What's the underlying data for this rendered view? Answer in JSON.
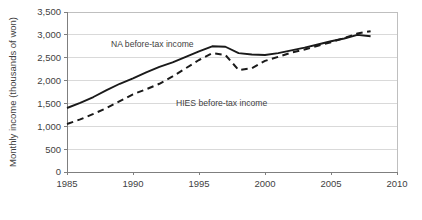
{
  "chart_data": {
    "type": "line",
    "title": "",
    "subtitle": "",
    "xlabel": "",
    "ylabel": "Monthly income (thousands of won)",
    "xlim": [
      1985,
      2010
    ],
    "ylim": [
      0,
      3500
    ],
    "grid": true,
    "legend_position": "inline-annotation",
    "x_ticks": [
      "1985",
      "1990",
      "1995",
      "2000",
      "2005",
      "2010"
    ],
    "x_tick_values": [
      1985,
      1990,
      1995,
      2000,
      2005,
      2010
    ],
    "y_ticks": [
      "0",
      "500",
      "1,000",
      "1,500",
      "2,000",
      "2,500",
      "3,000",
      "3,500"
    ],
    "y_tick_values": [
      0,
      500,
      1000,
      1500,
      2000,
      2500,
      3000,
      3500
    ],
    "series": [
      {
        "name": "NA before-tax income",
        "style": "solid",
        "color": "#1a1a1a",
        "x": [
          1985,
          1986,
          1987,
          1988,
          1989,
          1990,
          1991,
          1992,
          1993,
          1994,
          1995,
          1996,
          1997,
          1998,
          1999,
          2000,
          2001,
          2002,
          2003,
          2004,
          2005,
          2006,
          2007,
          2008
        ],
        "values": [
          1400,
          1510,
          1640,
          1790,
          1930,
          2050,
          2180,
          2300,
          2400,
          2520,
          2640,
          2750,
          2740,
          2600,
          2570,
          2560,
          2600,
          2660,
          2720,
          2790,
          2860,
          2920,
          3000,
          2970
        ]
      },
      {
        "name": "HIES before-tax income",
        "style": "dashed",
        "color": "#1a1a1a",
        "x": [
          1985,
          1986,
          1987,
          1988,
          1989,
          1990,
          1991,
          1992,
          1993,
          1994,
          1995,
          1996,
          1997,
          1998,
          1999,
          2000,
          2001,
          2002,
          2003,
          2004,
          2005,
          2006,
          2007,
          2008
        ],
        "values": [
          1050,
          1150,
          1270,
          1400,
          1550,
          1700,
          1810,
          1930,
          2090,
          2270,
          2450,
          2600,
          2560,
          2230,
          2270,
          2430,
          2520,
          2610,
          2680,
          2760,
          2840,
          2930,
          3030,
          3080
        ]
      }
    ],
    "annotations": [
      {
        "text": "NA before-tax income",
        "x_px": 111,
        "y_px": 47,
        "anchor": "start"
      },
      {
        "text": "HIES before-tax income",
        "x_px": 176,
        "y_px": 106,
        "anchor": "start"
      }
    ]
  }
}
